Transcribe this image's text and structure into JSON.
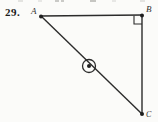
{
  "page": {
    "background": "#fbfbf9"
  },
  "problem": {
    "number": "29."
  },
  "diagram": {
    "type": "right-triangle-with-circled-point",
    "stroke_color": "#2b2b2b",
    "vertices": {
      "A": {
        "label": "A"
      },
      "B": {
        "label": "B"
      },
      "C": {
        "label": "C"
      }
    },
    "right_angle_at": "B",
    "point_symbol": "circled-dot-on-segment-AC"
  }
}
